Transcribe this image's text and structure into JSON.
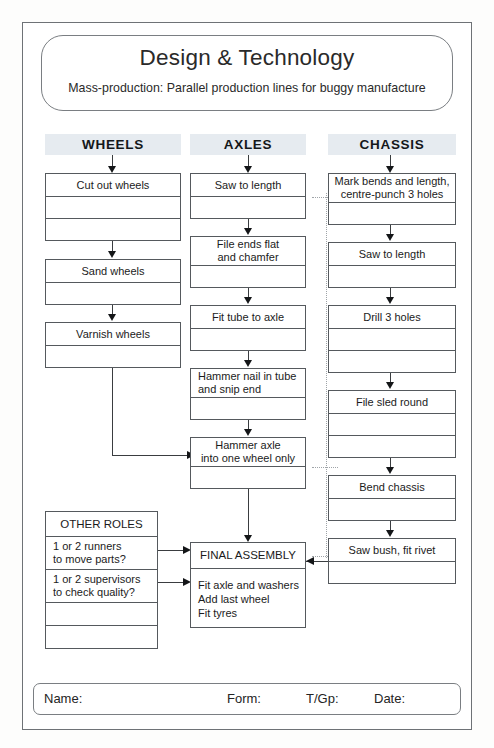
{
  "title": {
    "main": "Design & Technology",
    "subtitle": "Mass-production: Parallel production lines for buggy manufacture"
  },
  "columns": [
    {
      "header": "WHEELS",
      "steps": [
        {
          "label": "Cut out wheels",
          "extra_rows": 2
        },
        {
          "label": "Sand wheels",
          "extra_rows": 1
        },
        {
          "label": "Varnish wheels",
          "extra_rows": 1
        }
      ]
    },
    {
      "header": "AXLES",
      "steps": [
        {
          "label": "Saw to length",
          "extra_rows": 1
        },
        {
          "label": "File ends flat\nand chamfer",
          "extra_rows": 1
        },
        {
          "label": "Fit tube to axle",
          "extra_rows": 1
        },
        {
          "label": "Hammer nail in tube\nand snip end",
          "extra_rows": 1
        },
        {
          "label": "Hammer axle\ninto one wheel only",
          "extra_rows": 1
        }
      ]
    },
    {
      "header": "CHASSIS",
      "steps": [
        {
          "label": "Mark bends and length,\ncentre-punch 3 holes",
          "extra_rows": 1
        },
        {
          "label": "Saw to length",
          "extra_rows": 1
        },
        {
          "label": "Drill 3 holes",
          "extra_rows": 2
        },
        {
          "label": "File sled round",
          "extra_rows": 2
        },
        {
          "label": "Bend chassis",
          "extra_rows": 1
        },
        {
          "label": "Saw bush, fit rivet",
          "extra_rows": 1
        }
      ]
    }
  ],
  "other_roles": {
    "title": "OTHER ROLES",
    "items": [
      "1 or 2 runners\nto move parts?",
      "1 or 2 supervisors\nto check quality?"
    ],
    "empty_rows": 2
  },
  "final_assembly": {
    "title": "FINAL ASSEMBLY",
    "tasks": "Fit axle and washers\nAdd last wheel\nFit tyres"
  },
  "footer": {
    "name_label": "Name:",
    "form_label": "Form:",
    "group_label": "T/Gp:",
    "date_label": "Date:"
  },
  "colors": {
    "header_band": "#e6ebf0",
    "box_border": "#55595d",
    "page_border": "#6e7276",
    "connector": "#3a3d40",
    "dotted_divider": "#9fa4a8"
  }
}
